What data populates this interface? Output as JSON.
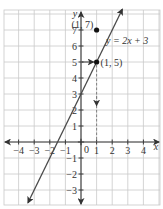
{
  "chart_data": {
    "type": "line",
    "title": "",
    "xlabel": "x",
    "ylabel": "y",
    "xlim": [
      -4.5,
      4.9
    ],
    "ylim": [
      -4.0,
      8.3
    ],
    "grid": true,
    "x_ticks": [
      -4,
      -3,
      -2,
      -1,
      1,
      2,
      3,
      4
    ],
    "x_tick_labels": [
      "−4",
      "−3",
      "−2",
      "−1",
      "1",
      "2",
      "3",
      "4"
    ],
    "y_ticks": [
      -3,
      -2,
      -1,
      1,
      2,
      3,
      4,
      5,
      6,
      7
    ],
    "y_tick_labels": [
      "−3",
      "−2",
      "−1",
      "1",
      "2",
      "3",
      "4",
      "5",
      "6",
      "7"
    ],
    "origin_label": "0",
    "series": [
      {
        "name": "y = 2x + 3",
        "equation": "y = 2x + 3",
        "slope": 2,
        "intercept": 3,
        "x": [
          -3.4,
          2.65
        ],
        "y": [
          -3.8,
          8.3
        ]
      }
    ],
    "points": [
      {
        "label": "(1, 7)",
        "x": 1,
        "y": 7
      },
      {
        "label": "(1, 5)",
        "x": 1,
        "y": 5
      }
    ],
    "annotations": [
      {
        "type": "arrow",
        "from": [
          0,
          5
        ],
        "to": [
          1,
          5
        ],
        "style": "solid"
      },
      {
        "type": "arrow",
        "from": [
          1,
          5
        ],
        "to": [
          1,
          0
        ],
        "style": "dashed"
      }
    ],
    "equation_label": "y = 2x + 3"
  }
}
